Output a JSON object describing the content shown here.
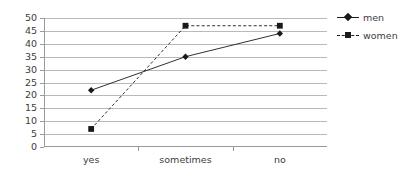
{
  "chart_data": {
    "type": "line",
    "title": "",
    "xlabel": "",
    "ylabel": "",
    "categories": [
      "yes",
      "sometimes",
      "no"
    ],
    "ylim": [
      0,
      50
    ],
    "yticks": [
      0,
      5,
      10,
      15,
      20,
      25,
      30,
      35,
      40,
      45,
      50
    ],
    "grid": true,
    "legend_position": "right",
    "series": [
      {
        "name": "men",
        "values": [
          22,
          35,
          44
        ],
        "marker": "diamond",
        "line_style": "solid",
        "color": "#1a1a1a"
      },
      {
        "name": "women",
        "values": [
          7,
          47,
          47
        ],
        "marker": "square",
        "line_style": "dashed",
        "color": "#1a1a1a"
      }
    ]
  },
  "axis": {
    "y_tick_labels": [
      "50",
      "45",
      "40",
      "35",
      "30",
      "25",
      "20",
      "15",
      "10",
      "5",
      "0"
    ],
    "x_tick_labels": [
      "yes",
      "sometimes",
      "no"
    ]
  },
  "legend": {
    "items": [
      {
        "label": "men"
      },
      {
        "label": "women"
      }
    ]
  },
  "colors": {
    "series": "#1a1a1a",
    "gridline": "#b9b9b9",
    "axis": "#9a9a9a",
    "text": "#3d3d3d",
    "background": "#ffffff"
  }
}
